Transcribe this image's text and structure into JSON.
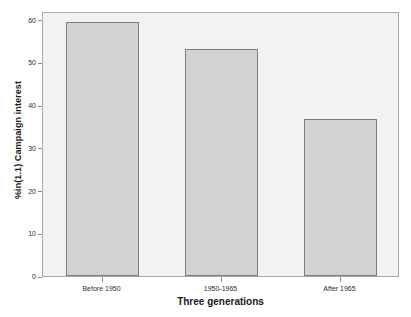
{
  "chart_data": {
    "type": "bar",
    "title": "",
    "xlabel": "Three generations",
    "ylabel": "%in(1.1) Campaign interest",
    "categories": [
      "Before 1950",
      "1950-1965",
      "After 1965"
    ],
    "values": [
      59.5,
      53.0,
      36.7
    ],
    "ylim": [
      0,
      62
    ],
    "yticks": [
      0,
      10,
      20,
      30,
      40,
      50,
      60
    ],
    "ytick_labels": [
      "0",
      "10",
      "20",
      "30",
      "40",
      "50",
      "60"
    ],
    "grid": false,
    "legend": null,
    "bar_color": "#d2d2d2",
    "bar_edge_color": "#7d7d7d",
    "plot_background": "#f2f2f2",
    "frame_color": "#a8a8a8",
    "figure_background": "#ffffff"
  }
}
